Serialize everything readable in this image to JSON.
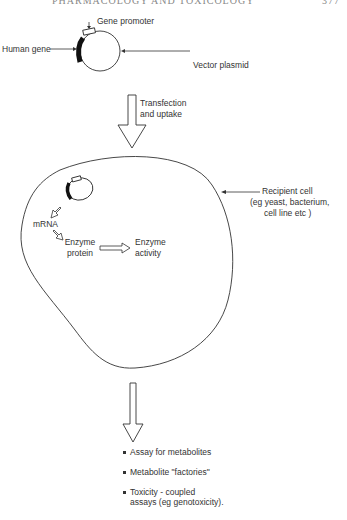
{
  "header": {
    "running_title": "PHARMACOLOGY AND TOXICOLOGY",
    "page_number": "377"
  },
  "plasmid": {
    "gene_promoter_label": "Gene promoter",
    "human_gene_label": "Human gene",
    "vector_plasmid_label": "Vector plasmid"
  },
  "transfer_arrow": {
    "line1": "Transfection",
    "line2": "and uptake"
  },
  "cell": {
    "recipient_line1": "Recipient cell",
    "recipient_line2": "(eg yeast, bacterium,",
    "recipient_line3": "cell line etc )",
    "mrna_label": "mRNA",
    "enzyme_protein_line1": "Enzyme",
    "enzyme_protein_line2": "protein",
    "enzyme_activity_line1": "Enzyme",
    "enzyme_activity_line2": "activity"
  },
  "outcomes": [
    {
      "text": "Assay for metabolites"
    },
    {
      "text": "Metabolite \"factories\""
    },
    {
      "text_line1": "Toxicity - coupled",
      "text_line2": "assays (eg genotoxicity)."
    }
  ],
  "colors": {
    "ink": "#333333",
    "header": "#888888",
    "background": "#ffffff"
  }
}
